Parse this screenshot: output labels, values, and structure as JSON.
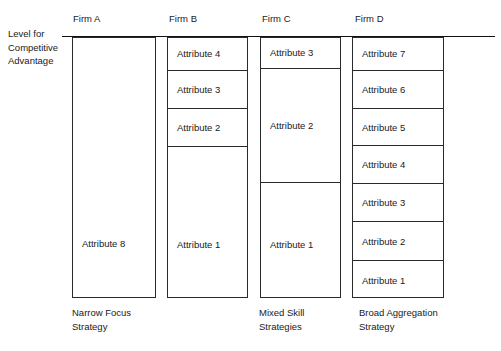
{
  "diagram": {
    "y_axis_label_lines": [
      "Level for",
      "Competitive",
      "Advantage"
    ],
    "columns": [
      {
        "header": "Firm A",
        "strategy_lines": [
          "Narrow Focus",
          "Strategy"
        ],
        "segments": [
          {
            "label": "Attribute 8"
          }
        ]
      },
      {
        "header": "Firm B",
        "strategy_lines": [
          "Mixed Skill",
          "Strategies"
        ],
        "segments": [
          {
            "label": "Attribute 4"
          },
          {
            "label": "Attribute 3"
          },
          {
            "label": "Attribute 2"
          },
          {
            "label": "Attribute 1"
          }
        ]
      },
      {
        "header": "Firm C",
        "strategy_lines": [
          "Mixed Skill",
          "Strategies"
        ],
        "segments": [
          {
            "label": "Attribute 3"
          },
          {
            "label": "Attribute 2"
          },
          {
            "label": "Attribute 1"
          }
        ]
      },
      {
        "header": "Firm D",
        "strategy_lines": [
          "Broad Aggregation",
          "Strategy"
        ],
        "segments": [
          {
            "label": "Attribute 7"
          },
          {
            "label": "Attribute 6"
          },
          {
            "label": "Attribute 5"
          },
          {
            "label": "Attribute 4"
          },
          {
            "label": "Attribute 3"
          },
          {
            "label": "Attribute 2"
          },
          {
            "label": "Attribute 1"
          }
        ]
      }
    ]
  }
}
